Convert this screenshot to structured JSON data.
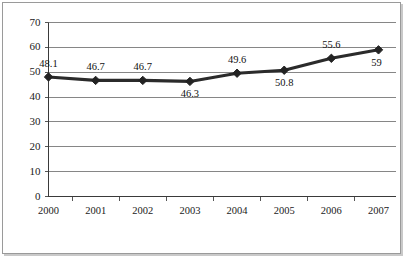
{
  "chart_data": {
    "type": "line",
    "title": "",
    "subtitle": "",
    "xlabel": "",
    "ylabel": "",
    "categories": [
      "2000",
      "2001",
      "2002",
      "2003",
      "2004",
      "2005",
      "2006",
      "2007"
    ],
    "values": [
      48.1,
      46.7,
      46.7,
      46.3,
      49.6,
      50.8,
      55.6,
      59
    ],
    "point_labels": [
      "48.1",
      "46.7",
      "46.7",
      "46.3",
      "49.6",
      "50.8",
      "55.6",
      "59"
    ],
    "label_positions": [
      "above",
      "above",
      "above",
      "below",
      "above",
      "below",
      "above",
      "below-right"
    ],
    "ylim": [
      0,
      70
    ],
    "ytick_values": [
      0,
      10,
      20,
      30,
      40,
      50,
      60,
      70
    ],
    "ytick_labels": [
      "0",
      "10",
      "20",
      "30",
      "40",
      "50",
      "60",
      "70"
    ],
    "xtick_labels": [
      "2000",
      "2001",
      "2002",
      "2003",
      "2004",
      "2005",
      "2006",
      "2007"
    ],
    "grid": true,
    "grid_axis": "y",
    "legend": false,
    "legend_position": "none",
    "marker": "diamond",
    "series": [
      {
        "name": "Series 1",
        "values": [
          48.1,
          46.7,
          46.7,
          46.3,
          49.6,
          50.8,
          55.6,
          59
        ]
      }
    ],
    "colors": {
      "line": "#2b2b2b",
      "marker": "#232323",
      "grid": "#868686",
      "axis": "#3a3a3a",
      "text": "#111111",
      "background": "#ffffff",
      "frame_border": "#9a9a9a"
    }
  }
}
